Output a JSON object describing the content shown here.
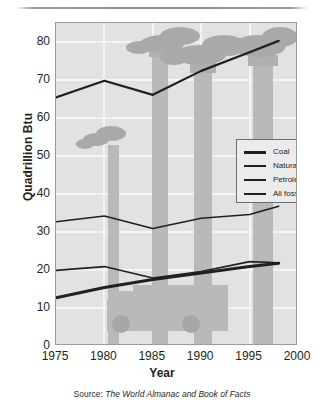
{
  "figure": {
    "source_prefix": "Source: ",
    "source_title": "The World Almanac and Book of Facts"
  },
  "chart_data": {
    "type": "line",
    "title": "",
    "xlabel": "Year",
    "ylabel": "Quadrillion Btu",
    "xlim": [
      1975,
      2000
    ],
    "ylim": [
      0,
      85
    ],
    "xticks": [
      1975,
      1980,
      1985,
      1990,
      1995,
      2000
    ],
    "yticks": [
      0,
      10,
      20,
      30,
      40,
      50,
      60,
      70,
      80
    ],
    "grid": true,
    "legend_position": "center-right",
    "x": [
      1975,
      1980,
      1985,
      1990,
      1995,
      1998
    ],
    "series": [
      {
        "name": "Coal",
        "values": [
          12.7,
          15.4,
          17.5,
          19.2,
          20.9,
          21.8
        ],
        "width": 3
      },
      {
        "name": "Natural gas",
        "values": [
          19.9,
          20.9,
          17.9,
          19.6,
          22.2,
          21.9
        ],
        "width": 1.6
      },
      {
        "name": "Petroleum",
        "values": [
          32.7,
          34.2,
          30.9,
          33.6,
          34.6,
          36.8
        ],
        "width": 1.6
      },
      {
        "name": "All fossil fuels",
        "values": [
          65.4,
          69.8,
          66.1,
          72.4,
          77.3,
          80.3
        ],
        "width": 2.2
      }
    ],
    "colors": {
      "line": "#231f20",
      "plot_background": "#e2e2e2",
      "grid": "#f4f4f4",
      "frame": "#9b9b9b",
      "artwork": "#b9b9b9"
    }
  },
  "legend": {
    "items": [
      {
        "label": "Coal"
      },
      {
        "label": "Natural gas"
      },
      {
        "label": "Petroleum"
      },
      {
        "label": "All fossil fuels"
      }
    ]
  }
}
